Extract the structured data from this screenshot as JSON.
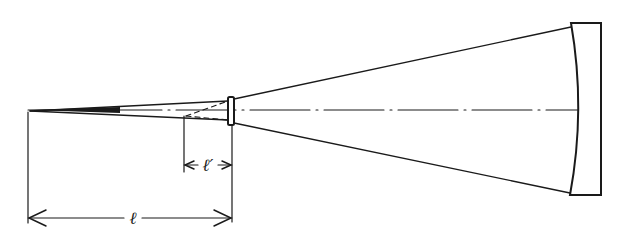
{
  "diagram": {
    "type": "optical-schematic",
    "labels": {
      "focal_distance": "ℓ",
      "secondary_distance": "ℓ′"
    },
    "elements": [
      {
        "name": "primary-mirror",
        "kind": "concave mirror"
      },
      {
        "name": "secondary-element",
        "kind": "small lens"
      },
      {
        "name": "focal-point",
        "kind": "convergence point"
      },
      {
        "name": "optical-axis",
        "kind": "dash-dot center line"
      }
    ],
    "colors": {
      "ink": "#1a1a1a",
      "background": "#ffffff"
    }
  }
}
